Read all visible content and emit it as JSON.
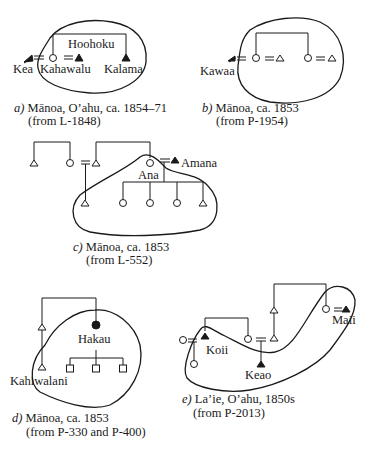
{
  "diagrams": {
    "a": {
      "letter": "a)",
      "caption_line1": " Mānoa, O’ahu, ca. 1854–71",
      "caption_line2": "(from L-1848)",
      "labels": {
        "hoohoku": "Hoohoku",
        "kea": "Kea",
        "kahawalu": "Kahawalu",
        "kalama": "Kalama"
      }
    },
    "b": {
      "letter": "b)",
      "caption_line1": " Mānoa, ca. 1853",
      "caption_line2": "(from P-1954)",
      "labels": {
        "kawaa": "Kawaa"
      }
    },
    "c": {
      "letter": "c)",
      "caption_line1": " Mānoa, ca. 1853",
      "caption_line2": "(from L-552)",
      "labels": {
        "amana": "Amana",
        "ana": "Ana"
      }
    },
    "d": {
      "letter": "d)",
      "caption_line1": " Mānoa, ca. 1853",
      "caption_line2": "(from P-330 and P-400)",
      "labels": {
        "hakau": "Hakau",
        "kahiwalani": "Kahiwalani"
      }
    },
    "e": {
      "letter": "e)",
      "caption_line1": " La’ie, O’ahu, 1850s",
      "caption_line2": "(from P-2013)",
      "labels": {
        "koii": "Koii",
        "keao": "Keao",
        "maii": "Maii"
      }
    }
  },
  "legend_symbols": {
    "open-triangle": "male",
    "open-circle": "female",
    "filled-triangle": "male (named individual)",
    "filled-circle": "female (named individual)",
    "open-square": "sex unspecified",
    "double-line": "marriage",
    "arrow": "movement"
  },
  "colors": {
    "ink": "#1a1a1a",
    "background": "#ffffff"
  }
}
